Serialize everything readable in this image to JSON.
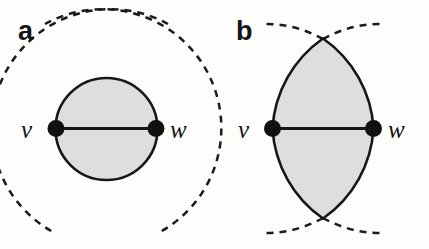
{
  "figure": {
    "background_color": "#fdfdfc",
    "fill_color": "#dedede",
    "stroke_color": "#161616",
    "width": 429,
    "height": 249
  },
  "panels": [
    {
      "id": "a",
      "label": "a",
      "shape_name": "shaded-disk-region",
      "description": "Shaded circular region bounded by two solid arcs between v and w, with dashed circular arcs crossing above and below",
      "vertices": [
        {
          "name": "v",
          "label": "v",
          "x": 56,
          "y": 128
        },
        {
          "name": "w",
          "label": "w",
          "x": 156,
          "y": 128
        }
      ],
      "labels": {
        "left_vertex": "v",
        "right_vertex": "w"
      }
    },
    {
      "id": "b",
      "label": "b",
      "shape_name": "shaded-lens-region",
      "description": "Shaded lens (vesica) region bounded by two solid arcs meeting at top and bottom tips, with dashed arcs continuing beyond the tips",
      "vertices": [
        {
          "name": "v",
          "label": "v",
          "x": 272,
          "y": 128
        },
        {
          "name": "w",
          "label": "w",
          "x": 374,
          "y": 128
        }
      ],
      "labels": {
        "left_vertex": "v",
        "right_vertex": "w"
      }
    }
  ]
}
